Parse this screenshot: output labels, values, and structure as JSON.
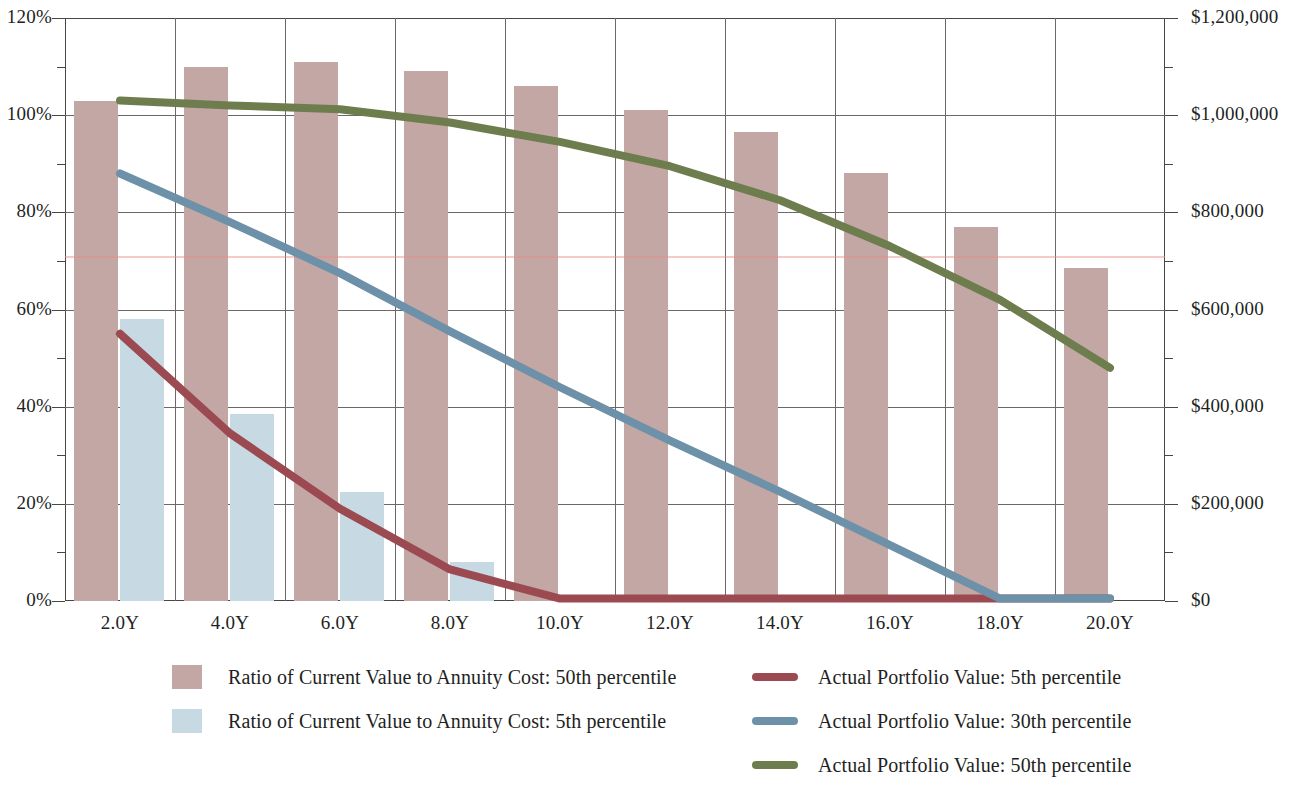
{
  "chart_data": {
    "type": "bar",
    "title": "",
    "subtitle": "",
    "xlabel": "",
    "categories": [
      "2.0Y",
      "4.0Y",
      "6.0Y",
      "8.0Y",
      "10.0Y",
      "12.0Y",
      "14.0Y",
      "16.0Y",
      "18.0Y",
      "20.0Y"
    ],
    "x_values": [
      2,
      4,
      6,
      8,
      10,
      12,
      14,
      16,
      18,
      20
    ],
    "grid": true,
    "legend_position": "bottom",
    "axes": {
      "left": {
        "label": "",
        "ylim": [
          0,
          120
        ],
        "unit": "percent",
        "tick_labels": [
          "0%",
          "20%",
          "40%",
          "60%",
          "80%",
          "100%",
          "120%"
        ],
        "tick_values": [
          0,
          20,
          40,
          60,
          80,
          100,
          120
        ],
        "minor_tick_values": [
          10,
          30,
          50,
          70,
          90,
          110
        ]
      },
      "right": {
        "label": "",
        "ylim": [
          0,
          1200000
        ],
        "unit": "dollars",
        "tick_labels": [
          "$0",
          "$200,000",
          "$400,000",
          "$600,000",
          "$800,000",
          "$1,000,000",
          "$1,200,000"
        ],
        "tick_values": [
          0,
          200000,
          400000,
          600000,
          800000,
          1000000,
          1200000
        ],
        "minor_tick_values": [
          100000,
          300000,
          500000,
          700000,
          900000,
          1100000
        ]
      }
    },
    "bar_series": [
      {
        "name": "Ratio of Current Value to Annuity Cost: 50th percentile",
        "short_name": "ratio-50th",
        "color": "#c3a7a4",
        "axis": "left",
        "values": [
          103,
          110,
          111,
          109,
          106,
          101,
          96.5,
          88,
          77,
          68.5
        ]
      },
      {
        "name": "Ratio of Current Value to Annuity Cost: 5th percentile",
        "short_name": "ratio-5th",
        "color": "#c7d9e2",
        "axis": "left",
        "values": [
          58,
          38.5,
          22.5,
          8,
          0,
          0,
          0,
          0,
          0,
          0
        ]
      }
    ],
    "line_series": [
      {
        "name": "Actual Portfolio Value: 5th percentile",
        "short_name": "portfolio-5th",
        "color": "#9b4a51",
        "axis": "right",
        "values": [
          550000,
          345000,
          190000,
          65000,
          5000,
          5000,
          5000,
          5000,
          5000,
          5000
        ]
      },
      {
        "name": "Actual Portfolio Value: 30th percentile",
        "short_name": "portfolio-30th",
        "color": "#6d91a9",
        "axis": "right",
        "values": [
          880000,
          780000,
          675000,
          555000,
          440000,
          330000,
          225000,
          115000,
          5000,
          5000
        ]
      },
      {
        "name": "Actual Portfolio Value: 50th percentile",
        "short_name": "portfolio-50th",
        "color": "#6e7d4e",
        "axis": "right",
        "values": [
          1030000,
          1020000,
          1012000,
          985000,
          945000,
          895000,
          825000,
          730000,
          620000,
          480000
        ]
      }
    ],
    "reference_line": {
      "name": "annuity-cost-reference",
      "value_percent": 71,
      "color": "#ec8c82"
    }
  },
  "legend": {
    "left_column": [
      {
        "label": "Ratio of Current Value to Annuity Cost: 50th percentile",
        "color": "#c3a7a4",
        "marker": "box"
      },
      {
        "label": "Ratio of Current Value to Annuity Cost: 5th percentile",
        "color": "#c7d9e2",
        "marker": "box"
      }
    ],
    "right_column": [
      {
        "label": "Actual Portfolio Value: 5th percentile",
        "color": "#9b4a51",
        "marker": "line"
      },
      {
        "label": "Actual Portfolio Value: 30th percentile",
        "color": "#6d91a9",
        "marker": "line"
      },
      {
        "label": "Actual Portfolio Value: 50th percentile",
        "color": "#6e7d4e",
        "marker": "line"
      }
    ]
  }
}
